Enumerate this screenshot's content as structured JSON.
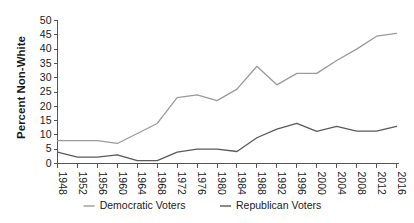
{
  "chart_data": {
    "type": "line",
    "title": "",
    "xlabel": "",
    "ylabel": "Percent Non-White",
    "xlim": [
      1948,
      2016
    ],
    "ylim": [
      0,
      50
    ],
    "grid": false,
    "legend_position": "bottom",
    "x": [
      1948,
      1952,
      1956,
      1960,
      1964,
      1968,
      1972,
      1976,
      1980,
      1984,
      1988,
      1992,
      1996,
      2000,
      2004,
      2008,
      2012,
      2016
    ],
    "categories": [
      "1948",
      "1952",
      "1956",
      "1960",
      "1964",
      "1968",
      "1972",
      "1976",
      "1980",
      "1984",
      "1988",
      "1992",
      "1996",
      "2000",
      "2004",
      "2008",
      "2012",
      "2016"
    ],
    "ytick_labels": [
      "0",
      "5",
      "10",
      "15",
      "20",
      "25",
      "30",
      "35",
      "40",
      "45",
      "50"
    ],
    "ytick_values": [
      0,
      5,
      10,
      15,
      20,
      25,
      30,
      35,
      40,
      45,
      50
    ],
    "series": [
      {
        "name": "Democratic Voters",
        "color": "#9a9a9a",
        "values": [
          8.0,
          8.0,
          8.0,
          7.0,
          10.5,
          14.0,
          23.0,
          24.0,
          22.0,
          26.0,
          34.0,
          27.5,
          31.5,
          31.5,
          36.0,
          40.0,
          44.5,
          45.5
        ]
      },
      {
        "name": "Republican Voters",
        "color": "#5a5a5a",
        "values": [
          4.0,
          2.2,
          2.2,
          3.0,
          1.0,
          1.0,
          4.0,
          5.0,
          5.0,
          4.2,
          9.0,
          12.0,
          14.0,
          11.2,
          13.0,
          11.3,
          11.3,
          13.0
        ]
      }
    ]
  },
  "legend": {
    "entries": [
      {
        "label": "Democratic Voters",
        "color": "#9a9a9a"
      },
      {
        "label": "Republican Voters",
        "color": "#5a5a5a"
      }
    ]
  },
  "axes": {
    "y_title": "Percent Non-White"
  }
}
